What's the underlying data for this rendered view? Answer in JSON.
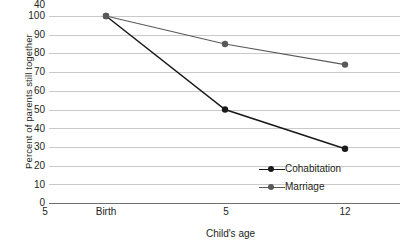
{
  "chart_data": {
    "type": "line",
    "title": "",
    "xlabel": "Child's age",
    "ylabel": "Percent of parents still together",
    "categories": [
      "Birth",
      "5",
      "12"
    ],
    "x_values": [
      0,
      5,
      12
    ],
    "ylim": [
      0,
      100
    ],
    "y_ticks": [
      100,
      90,
      80,
      70,
      60,
      50,
      40,
      30,
      20,
      10,
      0
    ],
    "grid": true,
    "grid_axis": "y",
    "legend_position": "bottom-right-inside",
    "series": [
      {
        "name": "Cohabitation",
        "values": [
          100,
          50,
          29
        ],
        "color": "#1a1a1a",
        "marker": "circle"
      },
      {
        "name": "Marriage",
        "values": [
          100,
          85,
          74
        ],
        "color": "#595959",
        "marker": "circle"
      }
    ]
  },
  "colors": {
    "gridline": "#c9c9c9",
    "axis": "#6f6f6f",
    "text": "#231f20",
    "background": "#ffffff"
  }
}
